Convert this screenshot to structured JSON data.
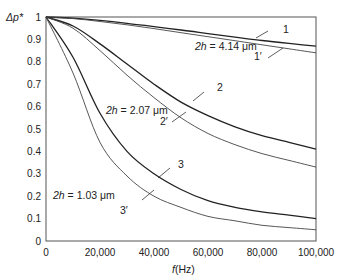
{
  "chart_data": {
    "type": "line",
    "title": "",
    "xlabel": "f(Hz)",
    "ylabel": "Δp*",
    "xlim": [
      0,
      100000
    ],
    "ylim": [
      0,
      1
    ],
    "grid": false,
    "x_ticks": [
      "0",
      "20,000",
      "40,000",
      "60,000",
      "80,000",
      "100,000"
    ],
    "y_ticks": [
      "0",
      "0.1",
      "0.2",
      "0.3",
      "0.4",
      "0.5",
      "0.6",
      "0.7",
      "0.8",
      "0.9",
      "1"
    ],
    "x": [
      0,
      10000,
      20000,
      30000,
      40000,
      50000,
      60000,
      70000,
      80000,
      90000,
      100000
    ],
    "series": [
      {
        "name": "1",
        "values": [
          1.0,
          0.995,
          0.985,
          0.972,
          0.957,
          0.942,
          0.926,
          0.91,
          0.895,
          0.882,
          0.87
        ]
      },
      {
        "name": "1'",
        "values": [
          1.0,
          0.993,
          0.98,
          0.965,
          0.948,
          0.93,
          0.912,
          0.894,
          0.876,
          0.858,
          0.84
        ]
      },
      {
        "name": "2",
        "values": [
          1.0,
          0.96,
          0.88,
          0.79,
          0.7,
          0.62,
          0.56,
          0.51,
          0.47,
          0.44,
          0.41
        ]
      },
      {
        "name": "2'",
        "values": [
          1.0,
          0.95,
          0.85,
          0.74,
          0.64,
          0.55,
          0.48,
          0.43,
          0.39,
          0.36,
          0.33
        ]
      },
      {
        "name": "3",
        "values": [
          1.0,
          0.82,
          0.57,
          0.4,
          0.3,
          0.23,
          0.18,
          0.15,
          0.13,
          0.115,
          0.1
        ]
      },
      {
        "name": "3'",
        "values": [
          1.0,
          0.75,
          0.44,
          0.29,
          0.2,
          0.15,
          0.11,
          0.09,
          0.07,
          0.06,
          0.05
        ]
      }
    ],
    "annotations": [
      {
        "text": "2h = 4.14 μm",
        "target": [
          "1",
          "1'"
        ]
      },
      {
        "text": "2h = 2.07 μm",
        "target": [
          "2",
          "2'"
        ]
      },
      {
        "text": "2h = 1.03 μm",
        "target": [
          "3",
          "3'"
        ]
      }
    ],
    "legend": "inline curve labels"
  },
  "labels": {
    "y_axis": "Δp*",
    "x_axis_f": "f",
    "x_axis_unit": "(Hz)",
    "curve_1": "1",
    "curve_1p": "1′",
    "curve_2": "2",
    "curve_2p": "2′",
    "curve_3": "3",
    "curve_3p": "3′",
    "ann_1_2h": "2h",
    "ann_1_val": " = 4.14 μm",
    "ann_2_2h": "2h",
    "ann_2_val": " = 2.07 μm",
    "ann_3_2h": "2h",
    "ann_3_val": " = 1.03 μm"
  }
}
